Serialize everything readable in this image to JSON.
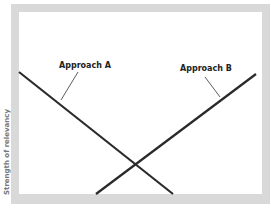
{
  "diagram": {
    "y_axis_label": "Strength of relevancy",
    "lines": [
      {
        "label": "Approach A",
        "direction": "decreasing",
        "x1": 19,
        "y1": 72,
        "x2": 173,
        "y2": 194
      },
      {
        "label": "Approach B",
        "direction": "increasing",
        "x1": 96,
        "y1": 194,
        "x2": 256,
        "y2": 74
      }
    ],
    "intersection": {
      "x": 135,
      "y": 164
    },
    "colors": {
      "line": "#2a2a2a",
      "frame": "#d9d9d9",
      "background": "#ffffff"
    }
  }
}
